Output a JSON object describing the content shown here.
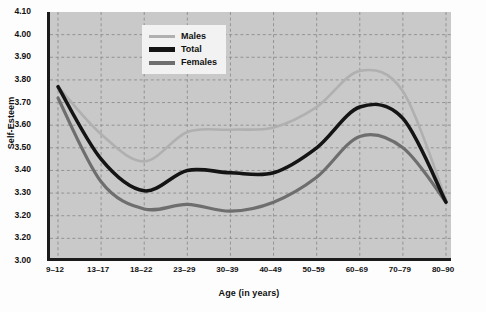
{
  "chart_data": {
    "type": "line",
    "title": "",
    "xlabel": "Age (in years)",
    "ylabel": "Self-Esteem",
    "categories": [
      "9–12",
      "13–17",
      "18–22",
      "23–29",
      "30–39",
      "40–49",
      "50–59",
      "60–69",
      "70–79",
      "80–90"
    ],
    "ylim": [
      3.0,
      4.1
    ],
    "ytick_labels": [
      "4.10",
      "4.00",
      "3.90",
      "3.80",
      "3.70",
      "3.60",
      "3.50",
      "3.40",
      "3.30",
      "3.20",
      "3.20",
      "3.00"
    ],
    "ytick_values": [
      4.1,
      4.0,
      3.9,
      3.8,
      3.7,
      3.6,
      3.5,
      3.4,
      3.3,
      3.2,
      3.1,
      3.0
    ],
    "grid": "dashed-both-axes",
    "legend_position": "top-center-left",
    "series": [
      {
        "name": "Males",
        "color": "#b0b0b0",
        "width": 2.6,
        "values": [
          3.77,
          3.56,
          3.44,
          3.57,
          3.58,
          3.59,
          3.68,
          3.84,
          3.75,
          3.27
        ]
      },
      {
        "name": "Total",
        "color": "#141414",
        "width": 3.6,
        "values": [
          3.77,
          3.45,
          3.31,
          3.4,
          3.39,
          3.39,
          3.5,
          3.68,
          3.63,
          3.26
        ]
      },
      {
        "name": "Females",
        "color": "#6e6e6e",
        "width": 3.2,
        "values": [
          3.72,
          3.35,
          3.23,
          3.25,
          3.22,
          3.26,
          3.37,
          3.55,
          3.5,
          3.26
        ]
      }
    ]
  },
  "legend": {
    "items": [
      {
        "label": "Males"
      },
      {
        "label": "Total"
      },
      {
        "label": "Females"
      }
    ]
  },
  "source": {
    "text": "Source: Richard W. Robins, Kali H. Trzesniewski, Jessica L. Tracy, Samuel D. Gosling, & Jeff Potter (2002). Global self-esteem across the lifespan. Psychology and Aging, 17(3), 423–434."
  }
}
